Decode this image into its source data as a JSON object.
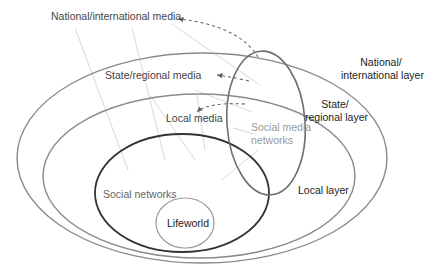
{
  "diagram": {
    "type": "nested-layers",
    "colors": {
      "layer_outline": "#8a8a8a",
      "social_networks_outline": "#333333",
      "lifeworld_outline": "#9a9a9a",
      "social_media_outline": "#6e6e6e",
      "influence_lines": "#d6d6d6",
      "dashed_arrows": "#666666",
      "social_media_text": "#9a9a9a"
    },
    "media_labels": {
      "national": "National/international media",
      "state": "State/regional media",
      "local": "Local media"
    },
    "layer_labels": {
      "national_line1": "National/",
      "national_line2": "international layer",
      "state_line1": "State/",
      "state_line2": "regional layer",
      "local": "Local layer"
    },
    "inner_labels": {
      "social_media_line1": "Social media",
      "social_media_line2": "networks",
      "social_networks": "Social networks",
      "lifeworld": "Lifeworld"
    }
  }
}
